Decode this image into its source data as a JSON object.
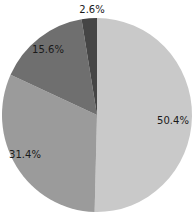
{
  "chart_data": {
    "type": "pie",
    "title": "",
    "start_angle_deg": 0,
    "direction": "clockwise",
    "slices": [
      {
        "label": "50.4%",
        "value": 50.4,
        "color": "#c9c9c9"
      },
      {
        "label": "31.4%",
        "value": 31.4,
        "color": "#9b9b9b"
      },
      {
        "label": "15.6%",
        "value": 15.6,
        "color": "#6f6f6f"
      },
      {
        "label": "2.6%",
        "value": 2.6,
        "color": "#454545"
      }
    ],
    "legend": null
  }
}
